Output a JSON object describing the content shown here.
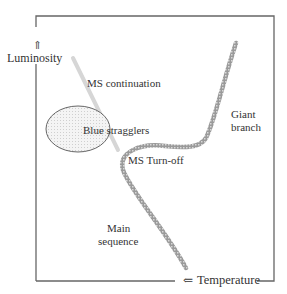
{
  "diagram": {
    "type": "schematic Hertzsprung-Russell diagram (color-magnitude diagram of a globular cluster)",
    "axes": {
      "y": {
        "label": "Luminosity",
        "arrow": "⇑"
      },
      "x": {
        "label": "Temperature",
        "arrow": "⇐"
      }
    },
    "labels": {
      "ms_continuation": "MS continuation",
      "blue_stragglers": "Blue stragglers",
      "giant_branch_line1": "Giant",
      "giant_branch_line2": "branch",
      "ms_turnoff": "MS Turn-off",
      "main_sequence_line1": "Main",
      "main_sequence_line2": "sequence"
    },
    "colors": {
      "frame": "#666666",
      "curve": "#888888",
      "continuation": "#dddddd",
      "ellipse_fill": "#eeeeee",
      "text": "#333333"
    }
  }
}
